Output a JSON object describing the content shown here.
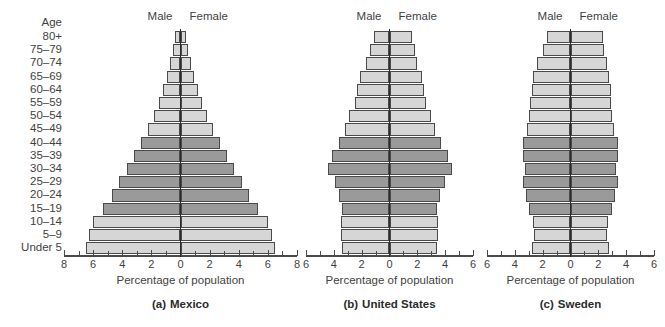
{
  "figure": {
    "age_axis_title": "Age",
    "age_groups": [
      "80+",
      "75–79",
      "70–74",
      "65–69",
      "60–64",
      "55–59",
      "50–54",
      "45–49",
      "40–44",
      "35–39",
      "30–34",
      "25–29",
      "20–24",
      "15–19",
      "10–14",
      "5–9",
      "Under 5"
    ],
    "male_label": "Male",
    "female_label": "Female",
    "x_axis_title": "Percentage of population",
    "colors": {
      "bar_light": "#d6d6d6",
      "bar_dark": "#9a9a9a",
      "bar_outline": "#4a4a4a",
      "axis": "#4a4a4a",
      "centerline": "#2b2b2b",
      "text": "#3f3f3f",
      "background": "#ffffff"
    }
  },
  "chart_data": [
    {
      "type": "bar",
      "title": "Mexico",
      "caption_letter": "(a)",
      "caption_name": "Mexico",
      "xlabel": "Percentage of population",
      "ylabel": "Age",
      "xlim": [
        -8,
        8
      ],
      "xticks": [
        8,
        6,
        4,
        2,
        0,
        2,
        4,
        6,
        8
      ],
      "xtick_values": [
        -8,
        -6,
        -4,
        -2,
        0,
        2,
        4,
        6,
        8
      ],
      "grid": false,
      "categories": [
        "80+",
        "75–79",
        "70–74",
        "65–69",
        "60–64",
        "55–59",
        "50–54",
        "45–49",
        "40–44",
        "35–39",
        "30–34",
        "25–29",
        "20–24",
        "15–19",
        "10–14",
        "5–9",
        "Under 5"
      ],
      "series": [
        {
          "name": "Male",
          "values": [
            0.4,
            0.5,
            0.7,
            0.9,
            1.2,
            1.5,
            1.8,
            2.2,
            2.7,
            3.2,
            3.7,
            4.2,
            4.7,
            5.3,
            6.0,
            6.3,
            6.5
          ]
        },
        {
          "name": "Female",
          "values": [
            0.4,
            0.5,
            0.7,
            0.9,
            1.2,
            1.5,
            1.8,
            2.2,
            2.7,
            3.2,
            3.7,
            4.2,
            4.7,
            5.3,
            6.0,
            6.3,
            6.5
          ]
        }
      ],
      "shading": [
        "light",
        "light",
        "light",
        "light",
        "light",
        "light",
        "light",
        "light",
        "dark",
        "dark",
        "dark",
        "dark",
        "dark",
        "dark",
        "light",
        "light",
        "light"
      ]
    },
    {
      "type": "bar",
      "title": "United States",
      "caption_letter": "(b)",
      "caption_name": "United States",
      "xlabel": "Percentage of population",
      "ylabel": "Age",
      "xlim": [
        -6,
        6
      ],
      "xticks": [
        6,
        4,
        2,
        0,
        2,
        4,
        6
      ],
      "xtick_values": [
        -6,
        -4,
        -2,
        0,
        2,
        4,
        6
      ],
      "grid": false,
      "categories": [
        "80+",
        "75–79",
        "70–74",
        "65–69",
        "60–64",
        "55–59",
        "50–54",
        "45–49",
        "40–44",
        "35–39",
        "30–34",
        "25–29",
        "20–24",
        "15–19",
        "10–14",
        "5–9",
        "Under 5"
      ],
      "series": [
        {
          "name": "Male",
          "values": [
            1.1,
            1.4,
            1.7,
            2.1,
            2.3,
            2.5,
            2.9,
            3.2,
            3.6,
            4.1,
            4.4,
            3.9,
            3.6,
            3.4,
            3.5,
            3.5,
            3.4
          ]
        },
        {
          "name": "Female",
          "values": [
            1.6,
            1.8,
            2.0,
            2.3,
            2.5,
            2.6,
            3.0,
            3.3,
            3.7,
            4.2,
            4.5,
            4.0,
            3.6,
            3.4,
            3.5,
            3.5,
            3.4
          ]
        }
      ],
      "shading": [
        "light",
        "light",
        "light",
        "light",
        "light",
        "light",
        "light",
        "light",
        "dark",
        "dark",
        "dark",
        "dark",
        "dark",
        "dark",
        "light",
        "light",
        "light"
      ]
    },
    {
      "type": "bar",
      "title": "Sweden",
      "caption_letter": "(c)",
      "caption_name": "Sweden",
      "xlabel": "Percentage of population",
      "ylabel": "Age",
      "xlim": [
        -6,
        6
      ],
      "xticks": [
        6,
        4,
        2,
        0,
        2,
        4,
        6
      ],
      "xtick_values": [
        -6,
        -4,
        -2,
        0,
        2,
        4,
        6
      ],
      "grid": false,
      "categories": [
        "80+",
        "75–79",
        "70–74",
        "65–69",
        "60–64",
        "55–59",
        "50–54",
        "45–49",
        "40–44",
        "35–39",
        "30–34",
        "25–29",
        "20–24",
        "15–19",
        "10–14",
        "5–9",
        "Under 5"
      ],
      "series": [
        {
          "name": "Male",
          "values": [
            1.7,
            2.0,
            2.4,
            2.7,
            2.8,
            2.9,
            3.0,
            3.1,
            3.4,
            3.4,
            3.3,
            3.4,
            3.2,
            3.0,
            2.7,
            2.6,
            2.8
          ]
        },
        {
          "name": "Female",
          "values": [
            2.3,
            2.4,
            2.6,
            2.8,
            2.9,
            2.9,
            3.0,
            3.1,
            3.4,
            3.4,
            3.3,
            3.4,
            3.2,
            3.0,
            2.7,
            2.6,
            2.8
          ]
        }
      ],
      "shading": [
        "light",
        "light",
        "light",
        "light",
        "light",
        "light",
        "light",
        "light",
        "dark",
        "dark",
        "dark",
        "dark",
        "dark",
        "dark",
        "light",
        "light",
        "light"
      ]
    }
  ]
}
